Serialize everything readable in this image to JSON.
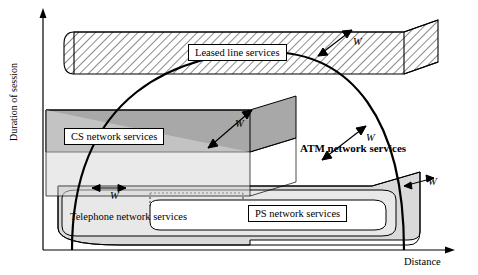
{
  "figure": {
    "axes": {
      "y_label": "Duration of session",
      "x_label": "Distance"
    },
    "regions": [
      {
        "name": "leased-line-services",
        "label": "Leased line services"
      },
      {
        "name": "cs-network-services",
        "label": "CS  network services"
      },
      {
        "name": "atm-network-services",
        "label": "ATM network services"
      },
      {
        "name": "telephone-network-services",
        "label": "Telephone network services"
      },
      {
        "name": "ps-network-services",
        "label": "PS network services"
      }
    ],
    "annotations": {
      "w_leased": "W",
      "w_cs": "W",
      "w_atm": "W",
      "w_telephone": "W",
      "w_ps": "W"
    },
    "colors": {
      "outline": "#000000",
      "cs_fill": "#a8a8a8",
      "telephone_fill": "#d9d9d9",
      "background": "#ffffff"
    }
  }
}
